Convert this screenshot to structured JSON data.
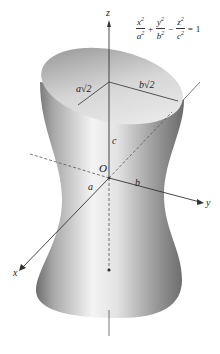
{
  "figure": {
    "type": "hyperboloid-of-one-sheet",
    "equation": {
      "terms": [
        {
          "num": "x",
          "den": "a",
          "exp": "2"
        },
        {
          "num": "y",
          "den": "b",
          "exp": "2"
        },
        {
          "num": "z",
          "den": "c",
          "exp": "2"
        }
      ],
      "ops": [
        "+",
        "−",
        "="
      ],
      "rhs": "1"
    },
    "axis_labels": {
      "x": "x",
      "y": "y",
      "z": "z"
    },
    "origin_label": "O",
    "segment_labels": {
      "a": "a",
      "b": "b",
      "c": "c",
      "a_sqrt2": "a√2",
      "b_sqrt2": "b√2"
    },
    "colors": {
      "surface_light": "#f2f2f2",
      "surface_dark": "#8a8a8a",
      "axis": "#333333",
      "background": "#ffffff"
    }
  }
}
